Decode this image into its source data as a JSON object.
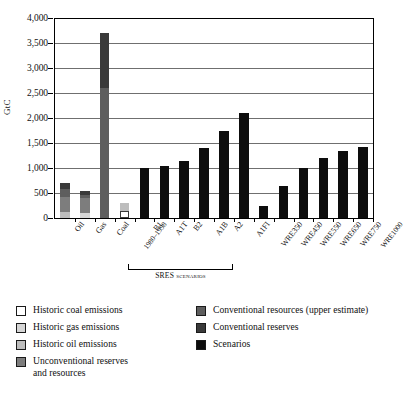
{
  "chart_data": {
    "type": "bar",
    "title": "",
    "xlabel": "",
    "ylabel": "GtC",
    "ylim": [
      0,
      4000
    ],
    "ytick_values": [
      0,
      500,
      1000,
      1500,
      2000,
      2500,
      3000,
      3500,
      4000
    ],
    "ytick_labels": [
      "0",
      "500",
      "1,000",
      "1,500",
      "2,000",
      "2,500",
      "3,000",
      "3,500",
      "4,000"
    ],
    "grid": true,
    "legend_position": "below-plot",
    "group_annotation": {
      "label": "SRES scenarios",
      "covers": [
        "B1",
        "A1T",
        "B2",
        "A1B",
        "A2",
        "A1FI"
      ]
    },
    "categories": [
      "Oil",
      "Gas",
      "Coal",
      "1980-1998",
      "B1",
      "A1T",
      "B2",
      "A1B",
      "A2",
      "A1FI",
      "WRE350",
      "WRE450",
      "WRE550",
      "WRE650",
      "WRE750",
      "WRE1000"
    ],
    "series": [
      {
        "name": "Historic coal emissions",
        "color": "#ffffff",
        "values": [
          0,
          0,
          0,
          150,
          0,
          0,
          0,
          0,
          0,
          0,
          0,
          0,
          0,
          0,
          0,
          0
        ]
      },
      {
        "name": "Historic gas emissions",
        "color": "#d5d5d5",
        "values": [
          0,
          110,
          0,
          0,
          0,
          0,
          0,
          0,
          0,
          0,
          0,
          0,
          0,
          0,
          0,
          0
        ]
      },
      {
        "name": "Historic oil emissions",
        "color": "#bdbdbd",
        "values": [
          130,
          0,
          0,
          150,
          0,
          0,
          0,
          0,
          0,
          0,
          0,
          0,
          0,
          0,
          0,
          0
        ]
      },
      {
        "name": "Unconventional reserves and resources",
        "color": "#7d7d7d",
        "values": [
          300,
          300,
          0,
          0,
          0,
          0,
          0,
          0,
          0,
          0,
          0,
          0,
          0,
          0,
          0,
          0
        ]
      },
      {
        "name": "Conventional resources (upper estimate)",
        "color": "#5e5e5e",
        "values": [
          150,
          50,
          2600,
          0,
          0,
          0,
          0,
          0,
          0,
          0,
          0,
          0,
          0,
          0,
          0,
          0
        ]
      },
      {
        "name": "Conventional reserves",
        "color": "#3a3a3a",
        "values": [
          120,
          90,
          1100,
          0,
          0,
          0,
          0,
          0,
          0,
          0,
          0,
          0,
          0,
          0,
          0,
          0
        ]
      },
      {
        "name": "Scenarios",
        "color": "#0d0d0d",
        "values": [
          0,
          0,
          0,
          0,
          1000,
          1050,
          1150,
          1400,
          1750,
          2100,
          250,
          650,
          1000,
          1200,
          1350,
          1430
        ]
      }
    ],
    "bar_totals": [
      700,
      550,
      3700,
      300,
      1000,
      1050,
      1150,
      1400,
      1750,
      2100,
      250,
      650,
      1000,
      1200,
      1350,
      1430
    ]
  },
  "axis": {
    "y_title": "GtC",
    "y_ticks": [
      "4,000",
      "3,500",
      "3,000",
      "2,500",
      "2,000",
      "1,500",
      "1,000",
      "500",
      "0"
    ]
  },
  "x_categories": [
    {
      "label": "Oil"
    },
    {
      "label": "Gas"
    },
    {
      "label": "Coal"
    },
    {
      "label": "1980–1998"
    },
    {
      "label": "B1"
    },
    {
      "label": "A1T"
    },
    {
      "label": "B2"
    },
    {
      "label": "A1B"
    },
    {
      "label": "A2"
    },
    {
      "label": "A1FI"
    },
    {
      "label": "WRE350"
    },
    {
      "label": "WRE450"
    },
    {
      "label": "WRE550"
    },
    {
      "label": "WRE650"
    },
    {
      "label": "WRE750"
    },
    {
      "label": "WRE1000"
    }
  ],
  "sres": {
    "caption": "SRES scenarios"
  },
  "legend": {
    "left": [
      {
        "label": "Historic coal emissions",
        "label2": "",
        "color": "#ffffff"
      },
      {
        "label": "Historic gas emissions",
        "label2": "",
        "color": "#d5d5d5"
      },
      {
        "label": "Historic oil emissions",
        "label2": "",
        "color": "#bdbdbd"
      },
      {
        "label": "Unconventional reserves",
        "label2": "and resources",
        "color": "#7d7d7d"
      }
    ],
    "right": [
      {
        "label": "Conventional resources (upper estimate)",
        "label2": "",
        "color": "#5e5e5e"
      },
      {
        "label": "Conventional reserves",
        "label2": "",
        "color": "#3a3a3a"
      },
      {
        "label": "Scenarios",
        "label2": "",
        "color": "#0d0d0d"
      }
    ]
  }
}
